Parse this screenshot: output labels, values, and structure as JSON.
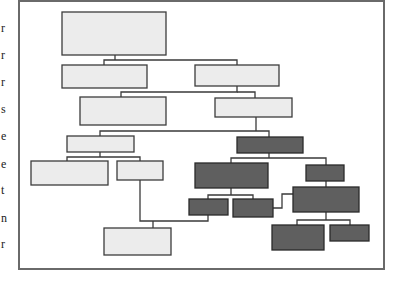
{
  "figure": {
    "type": "hierarchy-tree-diagram",
    "colors": {
      "frame": "#6a6a6a",
      "light_fill": "#ececec",
      "dark_fill": "#5f5f5f",
      "stroke": "#3a3a3a"
    },
    "frame": {
      "x": 19,
      "y": 1,
      "w": 365,
      "h": 268
    },
    "margin_fragments": [
      {
        "char": "r",
        "y": 22
      },
      {
        "char": "r",
        "y": 49
      },
      {
        "char": "r",
        "y": 76
      },
      {
        "char": "s",
        "y": 103
      },
      {
        "char": "e",
        "y": 130
      },
      {
        "char": "e",
        "y": 158
      },
      {
        "char": "t",
        "y": 184
      },
      {
        "char": "n",
        "y": 212
      },
      {
        "char": "r",
        "y": 238
      }
    ],
    "nodes": [
      {
        "id": "n1",
        "shade": "light",
        "x": 62,
        "y": 12,
        "w": 104,
        "h": 43
      },
      {
        "id": "n2",
        "shade": "light",
        "x": 62,
        "y": 65,
        "w": 85,
        "h": 23
      },
      {
        "id": "n3",
        "shade": "light",
        "x": 195,
        "y": 65,
        "w": 84,
        "h": 21
      },
      {
        "id": "n4",
        "shade": "light",
        "x": 80,
        "y": 97,
        "w": 86,
        "h": 28
      },
      {
        "id": "n5",
        "shade": "light",
        "x": 215,
        "y": 98,
        "w": 77,
        "h": 19
      },
      {
        "id": "n6",
        "shade": "light",
        "x": 67,
        "y": 136,
        "w": 67,
        "h": 16
      },
      {
        "id": "n7",
        "shade": "light",
        "x": 31,
        "y": 161,
        "w": 77,
        "h": 24
      },
      {
        "id": "n8",
        "shade": "light",
        "x": 117,
        "y": 161,
        "w": 46,
        "h": 19
      },
      {
        "id": "n9",
        "shade": "light",
        "x": 104,
        "y": 228,
        "w": 67,
        "h": 27
      },
      {
        "id": "dA",
        "shade": "dark",
        "x": 237,
        "y": 137,
        "w": 66,
        "h": 16
      },
      {
        "id": "dB",
        "shade": "dark",
        "x": 195,
        "y": 163,
        "w": 73,
        "h": 25
      },
      {
        "id": "dC",
        "shade": "dark",
        "x": 189,
        "y": 199,
        "w": 39,
        "h": 16
      },
      {
        "id": "dD",
        "shade": "dark",
        "x": 233,
        "y": 199,
        "w": 40,
        "h": 18
      },
      {
        "id": "dE",
        "shade": "dark",
        "x": 306,
        "y": 165,
        "w": 38,
        "h": 16
      },
      {
        "id": "dF",
        "shade": "dark",
        "x": 293,
        "y": 187,
        "w": 66,
        "h": 25
      },
      {
        "id": "dG",
        "shade": "dark",
        "x": 272,
        "y": 225,
        "w": 52,
        "h": 25
      },
      {
        "id": "dH",
        "shade": "dark",
        "x": 330,
        "y": 225,
        "w": 39,
        "h": 16
      }
    ],
    "connectors": [
      {
        "id": "c1",
        "points": "115,55 115,60"
      },
      {
        "id": "c2",
        "points": "104,65 104,60 237,60 237,65"
      },
      {
        "id": "c3",
        "points": "237,86 237,92 121,92 121,97"
      },
      {
        "id": "c4",
        "points": "237,92 255,92 255,98"
      },
      {
        "id": "c5",
        "points": "256,117 256,131"
      },
      {
        "id": "c6",
        "points": "100,136 100,131 269,131 269,137"
      },
      {
        "id": "c7",
        "points": "100,152 100,157"
      },
      {
        "id": "c8",
        "points": "67,161 67,157 140,157 140,161"
      },
      {
        "id": "c9",
        "points": "140,180 140,221 208,221 208,215"
      },
      {
        "id": "c10",
        "points": "153,221 153,228"
      },
      {
        "id": "c11",
        "points": "269,153 269,158"
      },
      {
        "id": "c12",
        "points": "231,163 231,158 326,158 326,165"
      },
      {
        "id": "c13",
        "points": "231,188 231,195"
      },
      {
        "id": "c14",
        "points": "208,199 208,195 253,195 253,199"
      },
      {
        "id": "c15",
        "points": "326,181 326,187"
      },
      {
        "id": "c16",
        "points": "273,208 282,208 282,194 293,194"
      },
      {
        "id": "c17",
        "points": "326,212 326,220"
      },
      {
        "id": "c18",
        "points": "297,225 297,220 350,220 350,225"
      }
    ]
  }
}
